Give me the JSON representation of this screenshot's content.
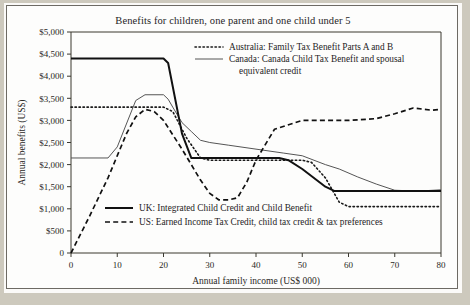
{
  "figure": {
    "title": "Benefits for children, one parent and one child under 5"
  },
  "chart_data": {
    "type": "line",
    "title": "Benefits for children, one parent and one child under 5",
    "xlabel": "Annual family income (US$ 000)",
    "ylabel": "Annual benefits (US$)",
    "xlim": [
      0,
      80
    ],
    "ylim": [
      0,
      5000
    ],
    "xticks": [
      0,
      10,
      20,
      30,
      40,
      50,
      60,
      70,
      80
    ],
    "xtick_labels": [
      "0",
      "10",
      "20",
      "30",
      "40",
      "50",
      "60",
      "70",
      "80"
    ],
    "yticks": [
      0,
      500,
      1000,
      1500,
      2000,
      2500,
      3000,
      3500,
      4000,
      4500,
      5000
    ],
    "ytick_labels": [
      "0",
      "$500",
      "$1,000",
      "$1,500",
      "$2,000",
      "$2,500",
      "$3,000",
      "$3,500",
      "$4,000",
      "$4,500",
      "$5,000"
    ],
    "grid": false,
    "legend_position": "inside-top-right and inside-bottom-center",
    "series": [
      {
        "name": "Australia: Family Tax Benefit Parts A and B",
        "style": "dotted",
        "color": "#1a1a1a",
        "x": [
          0,
          10,
          20,
          22,
          25,
          28,
          30,
          40,
          50,
          52,
          55,
          58,
          60,
          70,
          80
        ],
        "values": [
          3300,
          3300,
          3300,
          3200,
          2600,
          2150,
          2100,
          2100,
          2100,
          2050,
          1700,
          1150,
          1050,
          1050,
          1050
        ]
      },
      {
        "name": "Canada: Canada Child Tax Benefit and spousal equivalent credit",
        "style": "solid-thin",
        "color": "#555555",
        "x": [
          0,
          8,
          10,
          14,
          16,
          20,
          21,
          22,
          24,
          26,
          28,
          30,
          34,
          40,
          46,
          50,
          55,
          58,
          62,
          66,
          70,
          75,
          80
        ],
        "values": [
          2150,
          2150,
          2400,
          3450,
          3580,
          3580,
          3480,
          3300,
          2950,
          2750,
          2550,
          2500,
          2440,
          2350,
          2260,
          2200,
          2000,
          1900,
          1720,
          1560,
          1420,
          1400,
          1430
        ]
      },
      {
        "name": "UK: Integrated Child Credit and Child Benefit",
        "style": "solid-thick",
        "color": "#111111",
        "x": [
          0,
          2,
          20,
          21,
          24,
          26,
          45,
          47,
          50,
          55,
          57,
          60,
          70,
          80
        ],
        "values": [
          4400,
          4400,
          4400,
          4300,
          2700,
          2150,
          2150,
          2100,
          1900,
          1500,
          1400,
          1400,
          1400,
          1400
        ]
      },
      {
        "name": "US: Earned Income Tax Credit, child tax credit & tax preferences",
        "style": "dashed",
        "color": "#111111",
        "x": [
          0,
          4,
          8,
          12,
          14,
          16,
          18,
          20,
          24,
          28,
          30,
          32,
          34,
          36,
          38,
          40,
          44,
          50,
          60,
          66,
          70,
          74,
          78,
          80
        ],
        "values": [
          0,
          830,
          1700,
          2700,
          3080,
          3250,
          3200,
          3000,
          2350,
          1650,
          1350,
          1200,
          1200,
          1250,
          1600,
          2100,
          2800,
          3000,
          3000,
          3040,
          3150,
          3280,
          3230,
          3250
        ]
      }
    ]
  },
  "legend_top": {
    "items": [
      {
        "label": "Australia: Family Tax Benefit Parts A and B",
        "style": "dotted",
        "color": "#1a1a1a"
      },
      {
        "label": "Canada: Canada Child Tax Benefit and spousal",
        "label2": "equivalent credit",
        "style": "solid-thin",
        "color": "#555555"
      }
    ]
  },
  "legend_bottom": {
    "items": [
      {
        "label": "UK: Integrated Child Credit and Child Benefit",
        "style": "solid-thick",
        "color": "#111111"
      },
      {
        "label": "US: Earned Income Tax Credit, child tax credit & tax preferences",
        "style": "dashed",
        "color": "#111111"
      }
    ]
  },
  "axes": {
    "y_title": "Annual benefits (US$)",
    "x_title": "Annual family income (US$ 000)"
  }
}
